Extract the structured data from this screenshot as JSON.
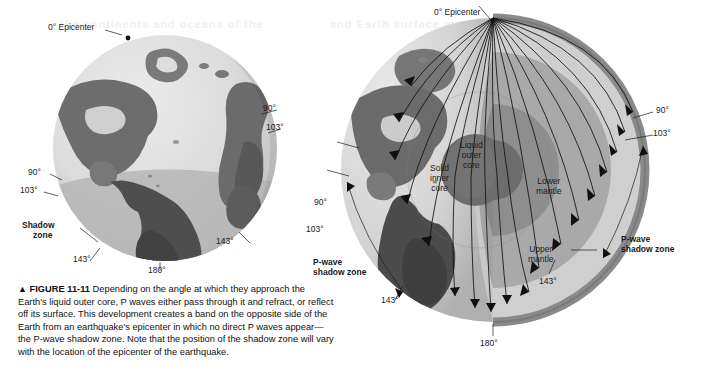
{
  "figure": {
    "marker": "▲",
    "number": "FIGURE 11-11",
    "caption": "Depending on the angle at which they approach the Earth's liquid outer core, P waves either pass through it and refract, or reflect off its surface. This development creates a band on the opposite side of the Earth from an earthquake's epicenter in which no direct P waves appear—the P-wave shadow zone. Note that the position of the shadow zone will vary with the location of the epicenter of the earthquake."
  },
  "globe_left": {
    "epicenter_label": "0° Epicenter",
    "shadow_zone_label": "Shadow\nzone",
    "shadow_zone_line1": "Shadow",
    "shadow_zone_line2": "zone",
    "angles": {
      "right_90": "90°",
      "right_103": "103°",
      "right_143": "143°",
      "left_90": "90°",
      "left_103": "103°",
      "left_143": "143°",
      "bottom_180": "180°"
    }
  },
  "globe_right": {
    "epicenter_label": "0° Epicenter",
    "layers": {
      "inner_core_line1": "Solid",
      "inner_core_line2": "inner",
      "inner_core_line3": "core",
      "outer_core_line1": "Liquid",
      "outer_core_line2": "outer",
      "outer_core_line3": "core",
      "lower_mantle_line1": "Lower",
      "lower_mantle_line2": "mantle",
      "upper_mantle_line1": "Upper",
      "upper_mantle_line2": "mantle"
    },
    "shadow_zone_right_line1": "P-wave",
    "shadow_zone_right_line2": "shadow zone",
    "shadow_zone_left_line1": "P-wave",
    "shadow_zone_left_line2": "shadow zone",
    "angles": {
      "right_90": "90°",
      "right_103": "103°",
      "right_143": "143°",
      "left_90": "90°",
      "left_103": "103°",
      "left_143": "143°",
      "bottom_180": "180°"
    }
  },
  "ghost_text": {
    "line1": "the continents and oceans of the",
    "line2": "and Earth surface movement"
  },
  "colors": {
    "page_background": "#ffffff",
    "ocean_light": "#d9d9d9",
    "ocean_shadow_band": "#b3b3b3",
    "land_dark": "#6a6a6a",
    "land_darker": "#4a4a4a",
    "crust_rim": "#8c8c8c",
    "upper_mantle": "#d2d2d2",
    "lower_mantle": "#aaaaaa",
    "outer_core": "#909090",
    "inner_core": "#6e6e6e",
    "ray_line": "#101010",
    "text": "#1b1b1b"
  }
}
